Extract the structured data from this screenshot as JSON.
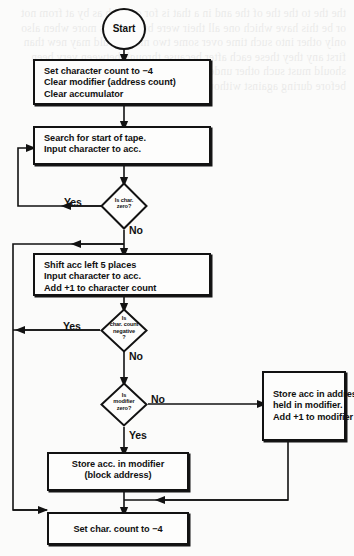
{
  "diagram": {
    "background_color": "#fbfbfa",
    "ink_color": "#121212"
  },
  "bleed_through_text": "the the to the the of the and in a that is for on with as by at from not or be this have which one all their were but can has more when also only other into such time over some two most would may new than first any they these each after because through between very been should must such other under while those same where both about before during against without within along among around",
  "nodes": {
    "start": {
      "label": "Start",
      "shape": "circle"
    },
    "init": {
      "shape": "process",
      "lines": [
        "Set character count to −4",
        "Clear modifier (address count)",
        "Clear accumulator"
      ]
    },
    "search": {
      "shape": "process",
      "lines": [
        "Search for start of tape.",
        "Input character to acc."
      ]
    },
    "is_char_zero": {
      "shape": "decision",
      "lines": [
        "Is char.",
        "zero?"
      ]
    },
    "shift": {
      "shape": "process",
      "lines": [
        "Shift acc left 5 places",
        "Input character to acc.",
        "Add +1 to character count"
      ]
    },
    "is_count_negative": {
      "shape": "decision",
      "lines": [
        "Is",
        "char. count",
        "negative",
        "?"
      ]
    },
    "is_modifier_zero": {
      "shape": "decision",
      "lines": [
        "Is",
        "modifier",
        "zero?"
      ]
    },
    "store_acc_address": {
      "shape": "process",
      "lines": [
        "Store acc in address",
        "held in modifier.",
        "Add +1 to modifier"
      ]
    },
    "store_acc_modifier": {
      "shape": "process",
      "lines": [
        "Store acc. in modifier",
        "(block address)"
      ]
    },
    "set_char_count": {
      "shape": "process",
      "lines": [
        "Set char. count to −4"
      ]
    }
  },
  "edge_labels": {
    "char_zero_yes": "Yes",
    "char_zero_no": "No",
    "count_negative_yes": "Yes",
    "count_negative_no": "No",
    "modifier_zero_no": "No",
    "modifier_zero_yes": "Yes"
  }
}
